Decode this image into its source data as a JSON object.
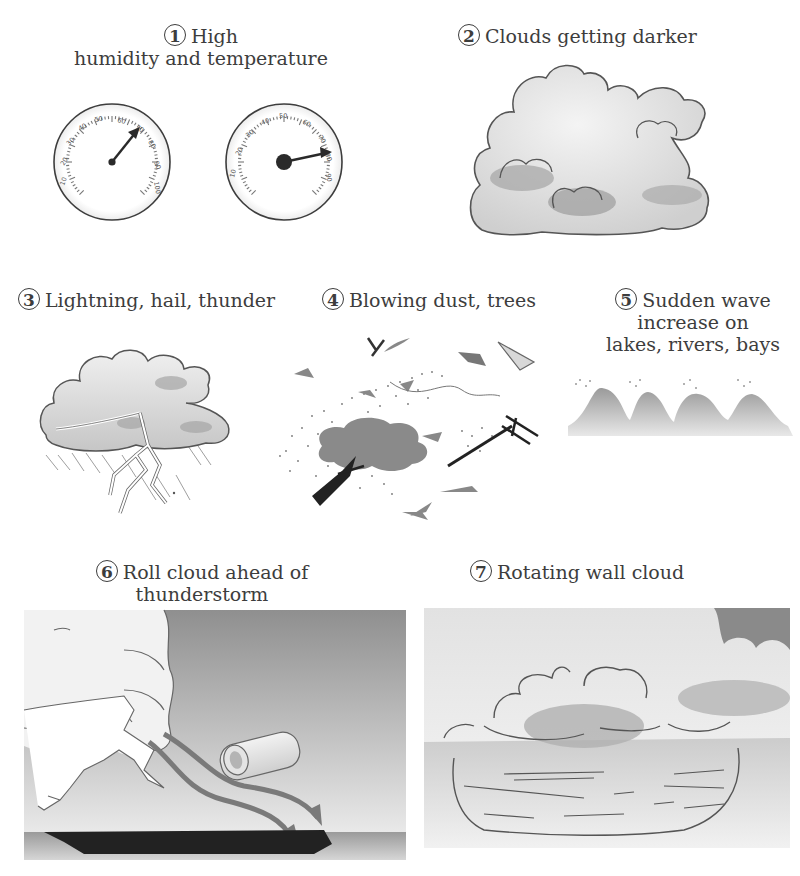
{
  "figure": {
    "colors": {
      "ink": "#3d3d3d",
      "cloud_fill": "#e6e6e6",
      "cloud_shade": "#a9a9a9",
      "sky_dark": "#8c8c8c",
      "arrow": "#7a7a7a",
      "ground": "#222222"
    },
    "panels": [
      {
        "number": "1",
        "caption_line1": "High",
        "caption_line2": "humidity and temperature",
        "icons": [
          "hygrometer-gauge-icon",
          "thermometer-gauge-icon"
        ],
        "gauges": [
          {
            "name": "humidity",
            "ticks": [
              "10",
              "20",
              "30",
              "40",
              "50",
              "60",
              "70",
              "80",
              "90",
              "100"
            ],
            "reading": "70"
          },
          {
            "name": "temperature",
            "ticks": [
              "10",
              "20",
              "30",
              "40",
              "50",
              "60",
              "70",
              "80",
              "90"
            ],
            "reading": "80"
          }
        ]
      },
      {
        "number": "2",
        "caption": "Clouds getting darker",
        "icon": "darkening-cloud-icon"
      },
      {
        "number": "3",
        "caption": "Lightning, hail, thunder",
        "icon": "thunderstorm-lightning-icon"
      },
      {
        "number": "4",
        "caption": "Blowing dust, trees",
        "icon": "wind-debris-tree-icon"
      },
      {
        "number": "5",
        "caption_line1": "Sudden wave",
        "caption_line2": "increase on",
        "caption_line3": "lakes, rivers, bays",
        "icon": "waves-icon"
      },
      {
        "number": "6",
        "caption_line1": "Roll cloud ahead of",
        "caption_line2": "thunderstorm",
        "icon": "roll-cloud-icon"
      },
      {
        "number": "7",
        "caption": "Rotating wall cloud",
        "icon": "wall-cloud-icon"
      }
    ]
  }
}
